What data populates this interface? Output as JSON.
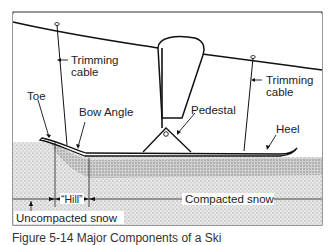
{
  "figure": {
    "labels": {
      "trimming_cable_left": [
        "Trimming",
        "cable"
      ],
      "trimming_cable_right": [
        "Trimming",
        "cable"
      ],
      "toe": "Toe",
      "bow_angle": "Bow Angle",
      "pedestal": "Pedestal",
      "heel": "Heel",
      "hill": "“Hill”",
      "compacted_snow": "Compacted snow",
      "uncompacted_snow": "Uncompacted snow"
    },
    "caption": "Figure 5-14  Major Components of a Ski"
  },
  "colors": {
    "line": "#1a1a1a",
    "snow": "#d8d8d8",
    "snow_dark": "#9a9a9a",
    "background": "#ffffff"
  }
}
